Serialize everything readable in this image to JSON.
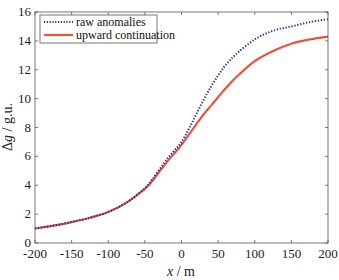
{
  "chart_data": {
    "type": "line",
    "title": "",
    "xlabel": "x / m",
    "ylabel": "Δg / g.u.",
    "xlim": [
      -200,
      200
    ],
    "ylim": [
      0,
      16
    ],
    "xticks": [
      -200,
      -150,
      -100,
      -50,
      0,
      50,
      100,
      150,
      200
    ],
    "yticks": [
      0,
      2,
      4,
      6,
      8,
      10,
      12,
      14,
      16
    ],
    "grid": false,
    "legend_position": "upper left",
    "x": [
      -200,
      -175,
      -150,
      -125,
      -100,
      -75,
      -50,
      -40,
      -30,
      -20,
      -10,
      0,
      10,
      20,
      30,
      40,
      50,
      60,
      75,
      100,
      125,
      150,
      175,
      200
    ],
    "series": [
      {
        "name": "raw anomalies",
        "style": "dotted",
        "color": "#2b2f8f",
        "values": [
          1.0,
          1.2,
          1.45,
          1.75,
          2.15,
          2.8,
          3.8,
          4.4,
          5.1,
          5.8,
          6.4,
          7.0,
          7.9,
          8.9,
          9.9,
          10.8,
          11.6,
          12.3,
          13.1,
          14.1,
          14.7,
          15.0,
          15.3,
          15.5
        ]
      },
      {
        "name": "upward continuation",
        "style": "solid",
        "color": "#e8533f",
        "values": [
          1.0,
          1.2,
          1.45,
          1.75,
          2.15,
          2.8,
          3.75,
          4.3,
          4.95,
          5.6,
          6.2,
          6.8,
          7.5,
          8.2,
          8.9,
          9.5,
          10.1,
          10.7,
          11.5,
          12.6,
          13.3,
          13.8,
          14.1,
          14.3
        ]
      }
    ]
  },
  "legend": {
    "items": [
      {
        "label": "raw anomalies"
      },
      {
        "label": "upward continuation"
      }
    ]
  },
  "axes": {
    "xlabel": "x / m",
    "ylabel": "Δg / g.u."
  }
}
